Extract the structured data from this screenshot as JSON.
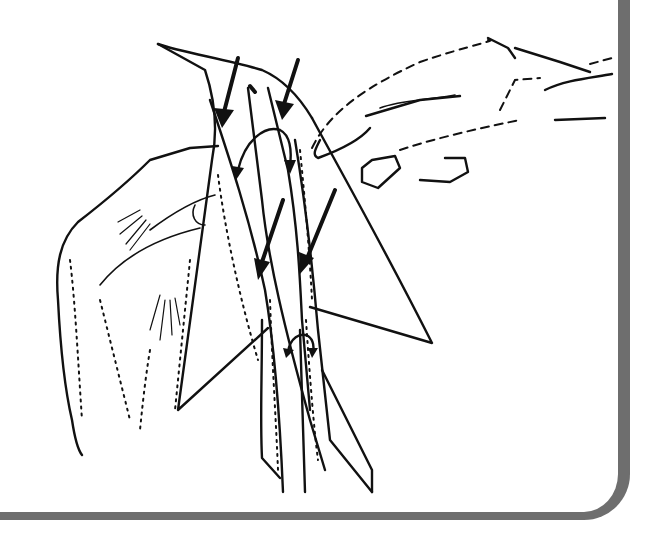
{
  "illustration": {
    "subject": "Two hands folding a paper airplane, with arrows showing fold directions",
    "style": "black ink line drawing on white",
    "colors": {
      "ink": "#111111",
      "background": "#ffffff",
      "frame": "#6e6e6e"
    },
    "fold_arrows_count": 6,
    "curved_fold_arrows_count": 2
  }
}
